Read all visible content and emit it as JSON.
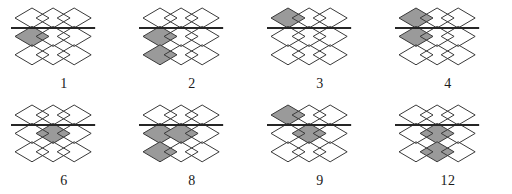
{
  "sheet": {
    "title": "Diamond lattice figure set",
    "background_color": "#ffffff",
    "outline_color": "#3a3a3a",
    "shade_color": "#9a9a9a",
    "line_color": "#262626",
    "label_color": "#1a1a1a",
    "grid": {
      "columns": 3,
      "rows": 3,
      "diamond_width": 34,
      "diamond_height": 20
    },
    "divider": {
      "description": "horizontal line across the lattice between row 1 and row 2",
      "after_row": 1,
      "thickness": 2
    }
  },
  "figures": [
    {
      "label": "1",
      "name": "figure-1",
      "shaded": [
        {
          "row": 2,
          "col": 1
        }
      ],
      "divider_after_row": 1
    },
    {
      "label": "2",
      "name": "figure-2",
      "shaded": [
        {
          "row": 2,
          "col": 1
        },
        {
          "row": 3,
          "col": 1
        }
      ],
      "divider_after_row": 1
    },
    {
      "label": "3",
      "name": "figure-3",
      "shaded": [
        {
          "row": 1,
          "col": 1
        }
      ],
      "divider_after_row": 1
    },
    {
      "label": "4",
      "name": "figure-4",
      "shaded": [
        {
          "row": 1,
          "col": 1
        },
        {
          "row": 2,
          "col": 1
        }
      ],
      "divider_after_row": 1
    },
    {
      "label": "6",
      "name": "figure-6",
      "shaded": [
        {
          "row": 2,
          "col": 2
        }
      ],
      "divider_after_row": 1
    },
    {
      "label": "8",
      "name": "figure-8",
      "shaded": [
        {
          "row": 2,
          "col": 1
        },
        {
          "row": 2,
          "col": 2
        },
        {
          "row": 3,
          "col": 1
        }
      ],
      "divider_after_row": 1
    },
    {
      "label": "9",
      "name": "figure-9",
      "shaded": [
        {
          "row": 1,
          "col": 1
        },
        {
          "row": 2,
          "col": 2
        }
      ],
      "divider_after_row": 1
    },
    {
      "label": "12",
      "name": "figure-12",
      "shaded": [
        {
          "row": 2,
          "col": 2
        },
        {
          "row": 3,
          "col": 2
        }
      ],
      "divider_after_row": 1
    }
  ],
  "layout": {
    "rows": [
      [
        "1",
        "2",
        "3",
        "4"
      ],
      [
        "6",
        "8",
        "9",
        "12"
      ]
    ]
  }
}
